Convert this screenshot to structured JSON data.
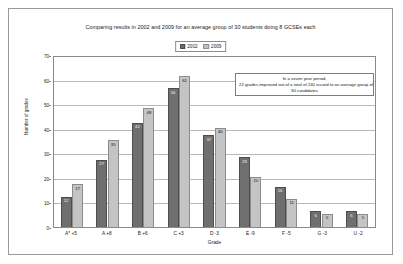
{
  "chart_data": {
    "type": "bar",
    "title": "Comparing results in 2002 and 2009 for an average group of 30 students doing 8 GCSEs each",
    "xlabel": "Grade",
    "ylabel": "Number of grades",
    "ylim": [
      0,
      70
    ],
    "yticks": [
      0,
      10,
      20,
      30,
      40,
      50,
      60,
      70
    ],
    "grid": true,
    "legend_position": "top-center",
    "categories": [
      "A* +5",
      "A +8",
      "B +6",
      "C +3",
      "D -3",
      "E -9",
      "F -5",
      "G -3",
      "U -2"
    ],
    "series": [
      {
        "name": "2002",
        "color": "#6f6f6f",
        "values": [
          12,
          27,
          42,
          56,
          37,
          28,
          16,
          6,
          6
        ]
      },
      {
        "name": "2009",
        "color": "#c4c4c4",
        "values": [
          17,
          35,
          48,
          61,
          40,
          20,
          11,
          5,
          5
        ]
      }
    ],
    "annotation": {
      "line1": "In a seven year period,",
      "line2": "22 grades improved out of a total of 240 issued to an average group of",
      "line3": "30 candidates"
    }
  }
}
